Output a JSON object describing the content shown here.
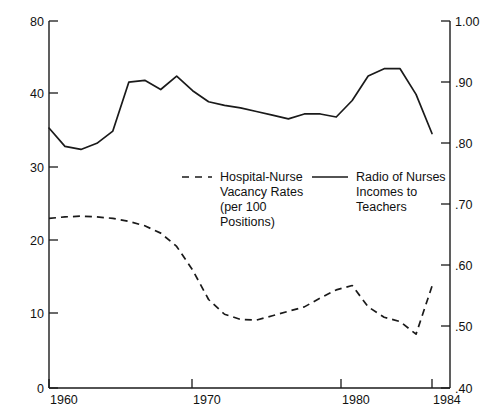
{
  "chart_data": {
    "type": "line",
    "title": "",
    "xlabel": "",
    "ylabel": "",
    "xlim": [
      1960,
      1984
    ],
    "grid": false,
    "legend_position": "center",
    "axes": {
      "left": {
        "label": "",
        "ticks": [
          "80",
          "40",
          "30",
          "20",
          "10",
          "0"
        ],
        "tick_values": [
          80,
          40,
          30,
          20,
          10,
          0
        ],
        "note": "broken/non-linear scale between 40 and 80"
      },
      "right": {
        "label": "",
        "ticks": [
          "1.00",
          ".90",
          ".80",
          ".70",
          ".60",
          ".50",
          ".40"
        ],
        "tick_values": [
          1.0,
          0.9,
          0.8,
          0.7,
          0.6,
          0.5,
          0.4
        ]
      },
      "bottom": {
        "ticks": [
          "1960",
          "1970",
          "1980",
          "1984"
        ],
        "tick_values": [
          1960,
          1970,
          1980,
          1984
        ]
      }
    },
    "x": [
      1960,
      1961,
      1962,
      1963,
      1964,
      1965,
      1966,
      1967,
      1968,
      1969,
      1970,
      1971,
      1972,
      1973,
      1974,
      1975,
      1976,
      1977,
      1978,
      1979,
      1980,
      1981,
      1982,
      1983,
      1984
    ],
    "series": [
      {
        "name": "Hospital-Nurse Vacancy Rates (per 100 Positions)",
        "axis": "left",
        "style": "dashed",
        "units": "per 100 positions",
        "values": [
          23.0,
          23.2,
          23.3,
          23.2,
          23.0,
          22.6,
          22.0,
          21.0,
          19.2,
          16.0,
          12.0,
          10.0,
          9.3,
          9.2,
          9.8,
          10.4,
          11.0,
          12.2,
          13.3,
          13.9,
          11.0,
          9.6,
          9.0,
          7.3,
          13.8
        ]
      },
      {
        "name": "Radio of Nurses Incomes to Teachers",
        "axis": "right",
        "style": "solid",
        "units": "ratio",
        "values": [
          0.825,
          0.795,
          0.79,
          0.8,
          0.82,
          0.9,
          0.903,
          0.888,
          0.91,
          0.886,
          0.868,
          0.862,
          0.858,
          0.852,
          0.846,
          0.84,
          0.848,
          0.848,
          0.843,
          0.87,
          0.91,
          0.922,
          0.922,
          0.88,
          0.816
        ]
      }
    ],
    "legend": [
      {
        "style": "dashed",
        "lines": [
          "Hospital-Nurse",
          "Vacancy Rates",
          "(per 100",
          "Positions)"
        ]
      },
      {
        "style": "solid",
        "lines": [
          "Radio of Nurses",
          "Incomes to",
          "Teachers"
        ]
      }
    ]
  }
}
